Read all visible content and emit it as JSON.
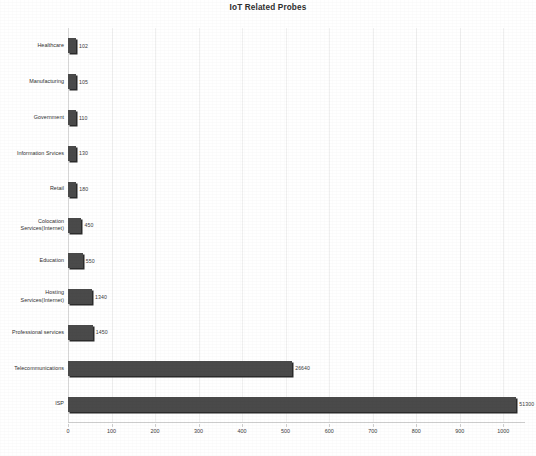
{
  "chart_data": {
    "type": "bar",
    "orientation": "horizontal",
    "title": "IoT Related Probes",
    "xlabel": "",
    "ylabel": "",
    "grid": true,
    "legend": false,
    "legend_position": "none",
    "bar_color": "#4a4a4a",
    "bar_shadow_color": "#2b2b2b",
    "background_color": "#ffffff",
    "gridline_color": "#f0f0f0",
    "axis_color": "#cfcfcf",
    "xlim": [
      0,
      1050
    ],
    "xticks": [
      0,
      100,
      200,
      300,
      400,
      500,
      600,
      700,
      800,
      900,
      1000
    ],
    "xtick_labels": [
      "0",
      "100",
      "200",
      "300",
      "400",
      "500",
      "600",
      "700",
      "800",
      "900",
      "1000"
    ],
    "categories": [
      "Healthcare",
      "Manufacturing",
      "Government",
      "Information Srvices",
      "Retail",
      "Colocation\nServices(Internet)",
      "Education",
      "Hosting\nServices(Internet)",
      "Professional services",
      "Telecommunications",
      "ISP"
    ],
    "values": [
      102,
      105,
      110,
      130,
      180,
      450,
      550,
      1340,
      1450,
      26640,
      51300
    ],
    "data_labels": [
      "102",
      "105",
      "110",
      "130",
      "180",
      "450",
      "550",
      "1340",
      "1450",
      "26640",
      "51300"
    ],
    "bar_axis_lengths": [
      12,
      12,
      13,
      16,
      19,
      31,
      34,
      55,
      57,
      515,
      1030
    ]
  }
}
